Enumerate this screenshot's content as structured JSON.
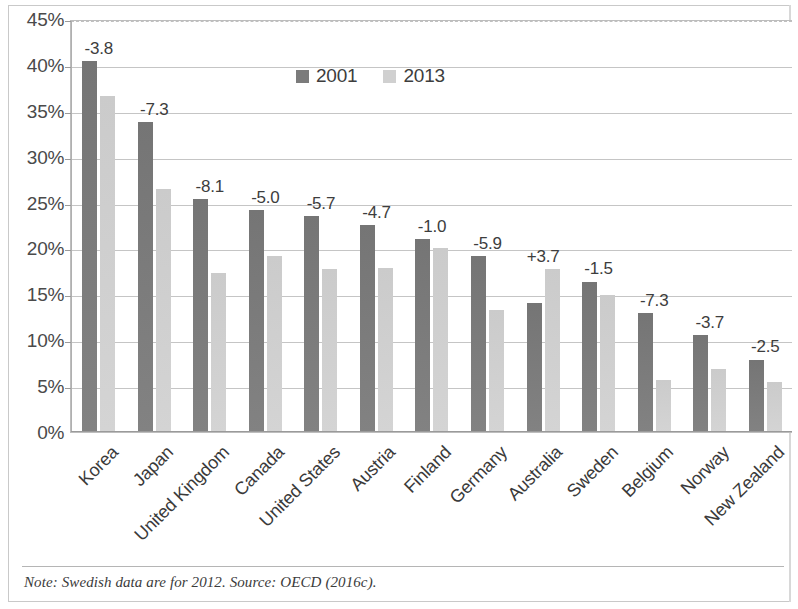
{
  "figure": {
    "note": "Note: Swedish data are for 2012. Source: OECD (2016c)."
  },
  "chart_data": {
    "type": "bar",
    "title": "",
    "subtitle": "",
    "xlabel": "",
    "ylabel": "",
    "ylim": [
      0,
      45
    ],
    "y_tick_labels": [
      "45%",
      "40%",
      "35%",
      "30%",
      "25%",
      "20%",
      "15%",
      "10%",
      "5%",
      "0%"
    ],
    "y_tick_values": [
      45,
      40,
      35,
      30,
      25,
      20,
      15,
      10,
      5,
      0
    ],
    "grid": true,
    "legend_position": "top-center",
    "categories": [
      "Korea",
      "Japan",
      "United Kingdom",
      "Canada",
      "United States",
      "Austria",
      "Finland",
      "Germany",
      "Australia",
      "Sweden",
      "Belgium",
      "Norway",
      "New Zealand"
    ],
    "series": [
      {
        "name": "2001",
        "color": "#7b7b7b",
        "values": [
          40.4,
          33.8,
          25.4,
          24.2,
          23.5,
          22.6,
          21.0,
          19.2,
          14.1,
          16.4,
          13.0,
          10.6,
          7.9
        ]
      },
      {
        "name": "2013",
        "color": "#d0d0d0",
        "values": [
          36.6,
          26.5,
          17.3,
          19.2,
          17.8,
          17.9,
          20.0,
          13.3,
          17.8,
          14.9,
          5.7,
          6.9,
          5.4
        ]
      }
    ],
    "data_labels": [
      "-3.8",
      "-7.3",
      "-8.1",
      "-5.0",
      "-5.7",
      "-4.7",
      "-1.0",
      "-5.9",
      "+3.7",
      "-1.5",
      "-7.3",
      "-3.7",
      "-2.5"
    ],
    "data_label_note": "change in percentage points between 2001 and 2013"
  }
}
